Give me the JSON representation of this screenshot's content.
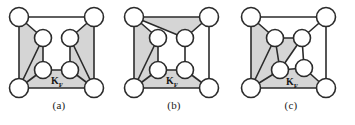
{
  "figure": {
    "background_color": "#ffffff",
    "face_fill_color": "#d5d5d5",
    "edge_color": "#2b2b2b",
    "node_fill_color": "#ffffff",
    "node_stroke_color": "#2b2b2b",
    "label_color": "#1a1a1a"
  },
  "panels": [
    {
      "id": "a",
      "caption": "(a)",
      "region_label": {
        "base": "K",
        "subscript": "F"
      },
      "node_count": 8,
      "nodes": [
        {
          "id": "tl",
          "name": "top-left-corner-node",
          "cx": 19,
          "cy": 17,
          "r": 9.5
        },
        {
          "id": "tr",
          "name": "top-right-corner-node",
          "cx": 94,
          "cy": 17,
          "r": 9.5
        },
        {
          "id": "bl",
          "name": "bottom-left-corner-node",
          "cx": 19,
          "cy": 88,
          "r": 9.5
        },
        {
          "id": "br",
          "name": "bottom-right-corner-node",
          "cx": 94,
          "cy": 88,
          "r": 9.5
        },
        {
          "id": "il",
          "name": "inner-upper-left-node",
          "cx": 43,
          "cy": 38,
          "r": 8.5
        },
        {
          "id": "ir",
          "name": "inner-upper-right-node",
          "cx": 70,
          "cy": 38,
          "r": 8.5
        },
        {
          "id": "ll",
          "name": "inner-lower-left-node",
          "cx": 43,
          "cy": 70,
          "r": 8.5
        },
        {
          "id": "lr",
          "name": "inner-lower-right-node",
          "cx": 70,
          "cy": 70,
          "r": 8.5
        }
      ],
      "edges": [
        [
          "tl",
          "tr"
        ],
        [
          "tl",
          "bl"
        ],
        [
          "tr",
          "br"
        ],
        [
          "bl",
          "br"
        ],
        [
          "tl",
          "il"
        ],
        [
          "tr",
          "ir"
        ],
        [
          "il",
          "ll"
        ],
        [
          "ir",
          "lr"
        ],
        [
          "ll",
          "lr"
        ],
        [
          "bl",
          "il"
        ],
        [
          "br",
          "ir"
        ],
        [
          "bl",
          "ll"
        ],
        [
          "br",
          "lr"
        ]
      ],
      "faces": [
        {
          "name": "left-shaded-face",
          "points": "19,17 43,38 43,70 19,88"
        },
        {
          "name": "right-shaded-face",
          "points": "94,17 70,38 70,70 94,88"
        },
        {
          "name": "bottom-shaded-face",
          "points": "19,88 43,70 70,70 94,88"
        }
      ],
      "label_pos": {
        "x": 57,
        "y": 84
      }
    },
    {
      "id": "b",
      "caption": "(b)",
      "region_label": {
        "base": "K",
        "subscript": "F"
      },
      "node_count": 8,
      "nodes": [
        {
          "id": "tl",
          "name": "top-left-corner-node",
          "cx": 19,
          "cy": 17,
          "r": 9.5
        },
        {
          "id": "tr",
          "name": "top-right-corner-node",
          "cx": 94,
          "cy": 17,
          "r": 9.5
        },
        {
          "id": "bl",
          "name": "bottom-left-corner-node",
          "cx": 19,
          "cy": 88,
          "r": 9.5
        },
        {
          "id": "br",
          "name": "bottom-right-corner-node",
          "cx": 94,
          "cy": 88,
          "r": 9.5
        },
        {
          "id": "il",
          "name": "inner-upper-left-node",
          "cx": 43,
          "cy": 38,
          "r": 8.5
        },
        {
          "id": "ir",
          "name": "inner-upper-right-node",
          "cx": 70,
          "cy": 38,
          "r": 8.5
        },
        {
          "id": "ll",
          "name": "inner-lower-left-node",
          "cx": 43,
          "cy": 70,
          "r": 8.5
        },
        {
          "id": "lr",
          "name": "inner-lower-right-node",
          "cx": 70,
          "cy": 70,
          "r": 8.5
        }
      ],
      "edges": [
        [
          "tl",
          "tr"
        ],
        [
          "tl",
          "bl"
        ],
        [
          "tr",
          "br"
        ],
        [
          "bl",
          "br"
        ],
        [
          "tl",
          "il"
        ],
        [
          "tl",
          "ir"
        ],
        [
          "tr",
          "ir"
        ],
        [
          "il",
          "ll"
        ],
        [
          "ir",
          "lr"
        ],
        [
          "ll",
          "lr"
        ],
        [
          "bl",
          "ll"
        ],
        [
          "bl",
          "il"
        ],
        [
          "br",
          "lr"
        ]
      ],
      "faces": [
        {
          "name": "left-shaded-face",
          "points": "19,17 43,38 43,70 19,88"
        },
        {
          "name": "top-shaded-face",
          "points": "19,17 94,17 70,38"
        },
        {
          "name": "bottom-shaded-face",
          "points": "19,88 43,70 70,70 94,88"
        }
      ],
      "label_pos": {
        "x": 57,
        "y": 84
      }
    },
    {
      "id": "c",
      "caption": "(c)",
      "region_label": {
        "base": "K",
        "subscript": "F"
      },
      "node_count": 8,
      "nodes": [
        {
          "id": "tl",
          "name": "top-left-corner-node",
          "cx": 19,
          "cy": 17,
          "r": 9.5
        },
        {
          "id": "tr",
          "name": "top-right-corner-node",
          "cx": 94,
          "cy": 17,
          "r": 9.5
        },
        {
          "id": "bl",
          "name": "bottom-left-corner-node",
          "cx": 19,
          "cy": 88,
          "r": 9.5
        },
        {
          "id": "br",
          "name": "bottom-right-corner-node",
          "cx": 94,
          "cy": 88,
          "r": 9.5
        },
        {
          "id": "il",
          "name": "inner-upper-left-node",
          "cx": 43,
          "cy": 38,
          "r": 8.5
        },
        {
          "id": "ir",
          "name": "inner-upper-right-node",
          "cx": 70,
          "cy": 38,
          "r": 8.5
        },
        {
          "id": "ll",
          "name": "inner-lower-left-node",
          "cx": 48,
          "cy": 70,
          "r": 8.5
        },
        {
          "id": "lr",
          "name": "inner-lower-right-node",
          "cx": 72,
          "cy": 68,
          "r": 8.5
        }
      ],
      "edges": [
        [
          "tl",
          "tr"
        ],
        [
          "tl",
          "bl"
        ],
        [
          "tr",
          "br"
        ],
        [
          "bl",
          "br"
        ],
        [
          "tl",
          "il"
        ],
        [
          "tr",
          "ir"
        ],
        [
          "il",
          "ir"
        ],
        [
          "il",
          "ll"
        ],
        [
          "ir",
          "lr"
        ],
        [
          "ll",
          "lr"
        ],
        [
          "ll",
          "ir"
        ],
        [
          "bl",
          "il"
        ],
        [
          "bl",
          "ll"
        ],
        [
          "br",
          "lr"
        ]
      ],
      "faces": [
        {
          "name": "left-shaded-face",
          "points": "19,17 43,38 48,70 19,88"
        },
        {
          "name": "center-shaded-face",
          "points": "43,38 70,38 48,70"
        },
        {
          "name": "bottom-shaded-face",
          "points": "19,88 48,70 72,68 94,88"
        }
      ],
      "label_pos": {
        "x": 60,
        "y": 85
      }
    }
  ]
}
